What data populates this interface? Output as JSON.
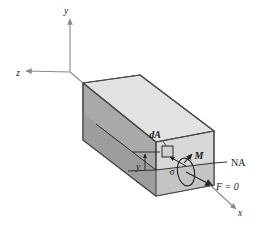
{
  "figure": {
    "labels": {
      "axis_y": "y",
      "axis_z": "z",
      "axis_x": "x",
      "area_element": "dA",
      "distance_y": "y",
      "stress": "σ",
      "moment": "M",
      "neutral_axis": "NA",
      "resultant_force": "F = 0"
    },
    "colors": {
      "top_face": "#e2e2e2",
      "side_face": "#a9a9a9",
      "front_face": "#d9d9d9",
      "front_face_lower": "#bdbdbd",
      "outline": "#4a4a4a",
      "axis_line": "#8a8a8a",
      "annotation_line": "#1f1f1f",
      "text": "#1a1a1a"
    },
    "geometry": {
      "origin": [
        70,
        72
      ],
      "y_axis_tip": [
        70,
        15
      ],
      "z_axis_tip": [
        22,
        72
      ],
      "x_axis_tip": [
        238,
        212
      ],
      "box_back_top": [
        83,
        83
      ],
      "box_front_top_right": [
        214,
        131
      ],
      "neutral_axis_start": [
        128,
        170
      ],
      "neutral_axis_end": [
        214,
        163
      ]
    }
  }
}
